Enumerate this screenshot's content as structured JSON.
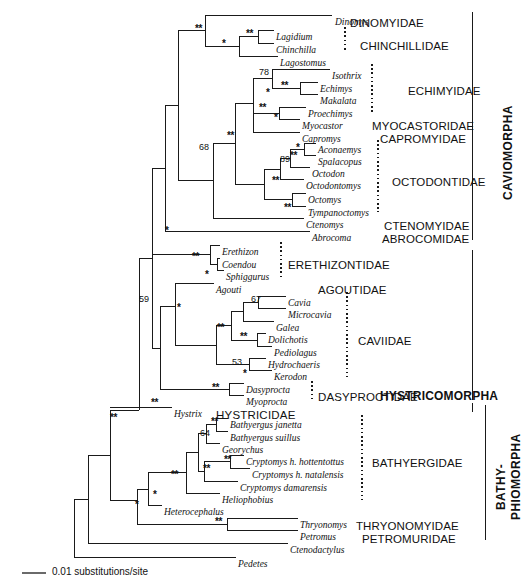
{
  "figure": {
    "type": "phylogenetic-tree",
    "scale_bar": {
      "label": "0.01 substitutions/site",
      "length_px": 24
    }
  },
  "taxa": [
    {
      "name": "Dinomys",
      "x": 335,
      "y": 18
    },
    {
      "name": "Lagidium",
      "x": 276,
      "y": 33
    },
    {
      "name": "Chinchilla",
      "x": 276,
      "y": 46
    },
    {
      "name": "Lagostomus",
      "x": 280,
      "y": 59
    },
    {
      "name": "Isothrix",
      "x": 332,
      "y": 72
    },
    {
      "name": "Echimys",
      "x": 320,
      "y": 85
    },
    {
      "name": "Makalata",
      "x": 320,
      "y": 97
    },
    {
      "name": "Proechimys",
      "x": 308,
      "y": 110
    },
    {
      "name": "Myocastor",
      "x": 302,
      "y": 122
    },
    {
      "name": "Capromys",
      "x": 302,
      "y": 135
    },
    {
      "name": "Aconaemys",
      "x": 318,
      "y": 146
    },
    {
      "name": "Spalacopus",
      "x": 318,
      "y": 158
    },
    {
      "name": "Octodon",
      "x": 312,
      "y": 170
    },
    {
      "name": "Octodontomys",
      "x": 306,
      "y": 182
    },
    {
      "name": "Octomys",
      "x": 308,
      "y": 196
    },
    {
      "name": "Tympanoctomys",
      "x": 308,
      "y": 209
    },
    {
      "name": "Ctenomys",
      "x": 306,
      "y": 221
    },
    {
      "name": "Abrocoma",
      "x": 312,
      "y": 234
    },
    {
      "name": "Erethizon",
      "x": 222,
      "y": 248
    },
    {
      "name": "Coendou",
      "x": 222,
      "y": 261
    },
    {
      "name": "Sphiggurus",
      "x": 226,
      "y": 273
    },
    {
      "name": "Agouti",
      "x": 216,
      "y": 286
    },
    {
      "name": "Cavia",
      "x": 288,
      "y": 299
    },
    {
      "name": "Microcavia",
      "x": 288,
      "y": 311
    },
    {
      "name": "Galea",
      "x": 276,
      "y": 324
    },
    {
      "name": "Dolichotis",
      "x": 268,
      "y": 336
    },
    {
      "name": "Pediolagus",
      "x": 274,
      "y": 349
    },
    {
      "name": "Hydrochaeris",
      "x": 268,
      "y": 361
    },
    {
      "name": "Kerodon",
      "x": 274,
      "y": 373
    },
    {
      "name": "Dasyprocta",
      "x": 246,
      "y": 386
    },
    {
      "name": "Myoprocta",
      "x": 246,
      "y": 398
    },
    {
      "name": "Hystrix",
      "x": 174,
      "y": 410
    },
    {
      "name": "Bathyergus janetta",
      "x": 230,
      "y": 421
    },
    {
      "name": "Bathyergus suillus",
      "x": 230,
      "y": 434
    },
    {
      "name": "Georychus",
      "x": 222,
      "y": 446
    },
    {
      "name": "Cryptomys h. hottentottus",
      "x": 246,
      "y": 458
    },
    {
      "name": "Cryptomys h. natalensis",
      "x": 252,
      "y": 471
    },
    {
      "name": "Cryptomys damarensis",
      "x": 240,
      "y": 484
    },
    {
      "name": "Heliophobius",
      "x": 222,
      "y": 496
    },
    {
      "name": "Heterocephalus",
      "x": 164,
      "y": 508
    },
    {
      "name": "Thryonomys",
      "x": 300,
      "y": 521
    },
    {
      "name": "Petromus",
      "x": 300,
      "y": 533
    },
    {
      "name": "Ctenodactylus",
      "x": 290,
      "y": 546
    },
    {
      "name": "Pedetes",
      "x": 238,
      "y": 560
    }
  ],
  "families": [
    {
      "name": "DINOMYIDAE",
      "x": 350,
      "y": 18
    },
    {
      "name": "CHINCHILLIDAE",
      "x": 360,
      "y": 41
    },
    {
      "name": "ECHIMYIDAE",
      "x": 408,
      "y": 86
    },
    {
      "name": "MYOCASTORIDAE",
      "x": 372,
      "y": 121
    },
    {
      "name": "CAPROMYIDAE",
      "x": 380,
      "y": 134
    },
    {
      "name": "OCTODONTIDAE",
      "x": 392,
      "y": 177
    },
    {
      "name": "CTENOMYIDAE",
      "x": 384,
      "y": 221
    },
    {
      "name": "ABROCOMIDAE",
      "x": 382,
      "y": 234
    },
    {
      "name": "ERETHIZONTIDAE",
      "x": 288,
      "y": 260
    },
    {
      "name": "AGOUTIDAE",
      "x": 318,
      "y": 285
    },
    {
      "name": "CAVIIDAE",
      "x": 358,
      "y": 336
    },
    {
      "name": "DASYPROCTIDAE",
      "x": 318,
      "y": 392
    },
    {
      "name": "BATHYERGIDAE",
      "x": 372,
      "y": 458
    },
    {
      "name": "THRYONOMYIDAE",
      "x": 356,
      "y": 521
    },
    {
      "name": "PETROMURIDAE",
      "x": 362,
      "y": 534
    }
  ],
  "suborders": [
    {
      "name": "HYSTRICIDAE",
      "x": 216,
      "y": 410,
      "bold": false
    },
    {
      "name": "HYSTRICOMORPHA",
      "x": 380,
      "y": 390,
      "bold": true
    }
  ],
  "vertical_labels": [
    {
      "name": "CAVIOMORPHA",
      "x": 502,
      "y": 200
    },
    {
      "name": "BATHY-",
      "x": 495,
      "y": 510
    },
    {
      "name": "PHIOMORPHA",
      "x": 510,
      "y": 520
    }
  ],
  "support_values": [
    {
      "value": "78",
      "x": 259,
      "y": 68
    },
    {
      "value": "68",
      "x": 199,
      "y": 143
    },
    {
      "value": "89",
      "x": 280,
      "y": 155
    },
    {
      "value": "59",
      "x": 139,
      "y": 295
    },
    {
      "value": "67",
      "x": 251,
      "y": 295
    },
    {
      "value": "53",
      "x": 232,
      "y": 358
    },
    {
      "value": "64",
      "x": 200,
      "y": 429
    }
  ],
  "support_stars": [
    {
      "mark": "**",
      "x": 195,
      "y": 24
    },
    {
      "mark": "**",
      "x": 246,
      "y": 29
    },
    {
      "mark": "*",
      "x": 222,
      "y": 39
    },
    {
      "mark": "**",
      "x": 281,
      "y": 81
    },
    {
      "mark": "*",
      "x": 266,
      "y": 88
    },
    {
      "mark": "**",
      "x": 259,
      "y": 103
    },
    {
      "mark": "*",
      "x": 274,
      "y": 113
    },
    {
      "mark": "**",
      "x": 227,
      "y": 131
    },
    {
      "mark": "*",
      "x": 296,
      "y": 143
    },
    {
      "mark": "**",
      "x": 290,
      "y": 151
    },
    {
      "mark": "**",
      "x": 272,
      "y": 176
    },
    {
      "mark": "**",
      "x": 284,
      "y": 203
    },
    {
      "mark": "*",
      "x": 165,
      "y": 226
    },
    {
      "mark": "**",
      "x": 192,
      "y": 252
    },
    {
      "mark": "*",
      "x": 205,
      "y": 270
    },
    {
      "mark": "*",
      "x": 177,
      "y": 303
    },
    {
      "mark": "**",
      "x": 217,
      "y": 323
    },
    {
      "mark": "**",
      "x": 240,
      "y": 332
    },
    {
      "mark": "*",
      "x": 243,
      "y": 369
    },
    {
      "mark": "**",
      "x": 212,
      "y": 383
    },
    {
      "mark": "**",
      "x": 151,
      "y": 398
    },
    {
      "mark": "**",
      "x": 211,
      "y": 417
    },
    {
      "mark": "**",
      "x": 224,
      "y": 455
    },
    {
      "mark": "**",
      "x": 203,
      "y": 464
    },
    {
      "mark": "**",
      "x": 171,
      "y": 470
    },
    {
      "mark": "*",
      "x": 153,
      "y": 490
    },
    {
      "mark": "*",
      "x": 135,
      "y": 500
    },
    {
      "mark": "**",
      "x": 215,
      "y": 517
    },
    {
      "mark": "**",
      "x": 110,
      "y": 413
    }
  ]
}
